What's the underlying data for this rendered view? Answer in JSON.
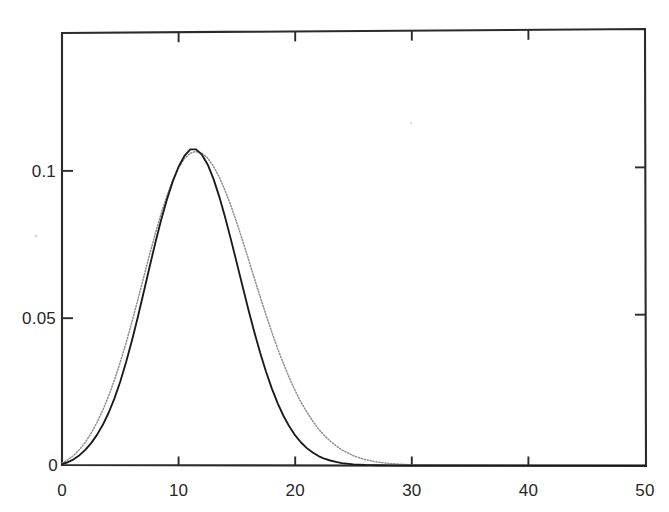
{
  "chart_data": {
    "type": "line",
    "title": "",
    "subtitle": "",
    "xlabel": "",
    "ylabel": "",
    "xlim": [
      0,
      50
    ],
    "ylim": [
      0,
      0.1468
    ],
    "xticks": [
      0,
      10,
      20,
      30,
      40,
      50
    ],
    "xticklabels": [
      "0",
      "10",
      "20",
      "30",
      "40",
      "50"
    ],
    "yticks": [
      0.05,
      0.1
    ],
    "yticklabels": [
      "0.05",
      "0.1"
    ],
    "grid": false,
    "legend": null,
    "legend_position": "none",
    "axis_style": "box-with-inward-ticks",
    "annotations": [],
    "series": [
      {
        "name": "solid-curve",
        "style": "solid",
        "color": "#1a1a1a",
        "x": [
          0,
          0.5,
          1,
          1.5,
          2,
          2.5,
          3,
          3.5,
          4,
          4.5,
          5,
          5.5,
          6,
          6.5,
          7,
          7.5,
          8,
          8.5,
          9,
          9.5,
          10,
          10.5,
          11,
          11.5,
          12,
          12.5,
          13,
          13.5,
          14,
          14.5,
          15,
          15.5,
          16,
          16.5,
          17,
          17.5,
          18,
          18.5,
          19,
          19.5,
          20,
          20.5,
          21,
          21.5,
          22,
          22.5,
          23,
          23.5,
          24,
          25,
          26,
          27,
          28,
          30,
          32,
          35,
          40,
          45,
          50
        ],
        "y": [
          0.0005,
          0.0011,
          0.0021,
          0.0035,
          0.0053,
          0.0076,
          0.0104,
          0.0138,
          0.0179,
          0.0228,
          0.0285,
          0.0351,
          0.0424,
          0.0503,
          0.0587,
          0.0672,
          0.0755,
          0.0833,
          0.0903,
          0.0964,
          0.1014,
          0.1051,
          0.1073,
          0.1073,
          0.1055,
          0.1021,
          0.0972,
          0.0911,
          0.0841,
          0.0765,
          0.0686,
          0.0606,
          0.0527,
          0.0452,
          0.0382,
          0.0318,
          0.0261,
          0.0211,
          0.0168,
          0.0132,
          0.0102,
          0.0078,
          0.0059,
          0.0044,
          0.0032,
          0.0023,
          0.0017,
          0.0012,
          0.0008,
          0.0004,
          0.0002,
          0.0001,
          5e-05,
          1e-05,
          5e-06,
          2e-06,
          1e-06,
          5e-07,
          2e-07
        ]
      },
      {
        "name": "dotted-curve",
        "style": "dotted",
        "color": "#8d8d8d",
        "x": [
          0,
          0.5,
          1,
          1.5,
          2,
          2.5,
          3,
          3.5,
          4,
          4.5,
          5,
          5.5,
          6,
          6.5,
          7,
          7.5,
          8,
          8.5,
          9,
          9.5,
          10,
          10.5,
          11,
          11.5,
          12,
          12.5,
          13,
          13.5,
          14,
          14.5,
          15,
          15.5,
          16,
          16.5,
          17,
          17.5,
          18,
          18.5,
          19,
          19.5,
          20,
          20.5,
          21,
          21.5,
          22,
          22.5,
          23,
          23.5,
          24,
          25,
          26,
          27,
          28,
          30,
          32,
          35,
          40,
          45,
          50
        ],
        "y": [
          0.0008,
          0.0019,
          0.0034,
          0.0054,
          0.0079,
          0.011,
          0.0146,
          0.0188,
          0.0236,
          0.0291,
          0.0351,
          0.0417,
          0.0488,
          0.0562,
          0.0638,
          0.0714,
          0.0787,
          0.0855,
          0.0916,
          0.0969,
          0.1011,
          0.1042,
          0.106,
          0.1066,
          0.106,
          0.1043,
          0.1015,
          0.0978,
          0.0932,
          0.088,
          0.0823,
          0.0762,
          0.0699,
          0.0635,
          0.0572,
          0.0511,
          0.0452,
          0.0396,
          0.0345,
          0.0297,
          0.0254,
          0.0215,
          0.0181,
          0.0151,
          0.0124,
          0.0102,
          0.0083,
          0.0067,
          0.0053,
          0.0033,
          0.002,
          0.0012,
          0.0007,
          0.0002,
          8e-05,
          2e-05,
          2e-06,
          3e-07,
          5e-08
        ]
      }
    ]
  },
  "figure": {
    "background_color": "#ffffff",
    "axis_color": "#2b2b2b",
    "tick_label_color": "#272727"
  }
}
